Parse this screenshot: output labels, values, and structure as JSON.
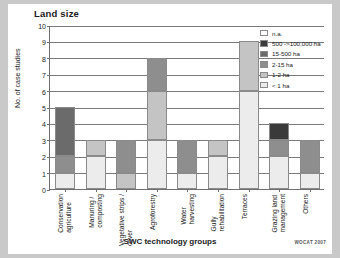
{
  "figure": {
    "title": "Land size",
    "credit": "WOCAT 2007"
  },
  "chart_data": {
    "type": "bar",
    "subtype": "stacked-bar",
    "title": "Land size",
    "xlabel": "SWC technology groups",
    "ylabel": "No. of case studies",
    "ylim": [
      0,
      10
    ],
    "ytick_labels": [
      "0",
      "1",
      "2",
      "3",
      "4",
      "5",
      "6",
      "7",
      "8",
      "9",
      "10"
    ],
    "grid": "horizontal",
    "legend_position": "top-right",
    "categories": [
      "Conservation agriculture",
      "Manuring / composting",
      "Vegetative strips / cover",
      "Agroforestry",
      "Water harvesting",
      "Gully rehabilitation",
      "Terraces",
      "Grazing land management",
      "Others"
    ],
    "series": [
      {
        "name": "< 1 ha",
        "color": "#ececec",
        "values": [
          1,
          2,
          0,
          3,
          1,
          2,
          6,
          2,
          1
        ]
      },
      {
        "name": "1-2 ha",
        "color": "#c4c4c4",
        "values": [
          0,
          1,
          1,
          3,
          0,
          1,
          3,
          0,
          0
        ]
      },
      {
        "name": "2-15 ha",
        "color": "#8e8e8e",
        "values": [
          1,
          0,
          2,
          2,
          2,
          0,
          0,
          1,
          2
        ]
      },
      {
        "name": "15-500 ha",
        "color": "#6b6b6b",
        "values": [
          3,
          0,
          0,
          0,
          0,
          0,
          0,
          0,
          0
        ]
      },
      {
        "name": "500 ->100,000 ha",
        "color": "#3a3a3a",
        "values": [
          0,
          0,
          0,
          0,
          0,
          0,
          0,
          1,
          0
        ]
      },
      {
        "name": "n.a.",
        "color": "#ffffff",
        "values": [
          0,
          0,
          0,
          0,
          0,
          0,
          0,
          0,
          0
        ]
      }
    ],
    "totals": [
      5,
      3,
      3,
      8,
      3,
      3,
      9,
      4,
      3
    ],
    "legend_order": [
      "n.a.",
      "500 ->100,000 ha",
      "15-500 ha",
      "2-15 ha",
      "1-2 ha",
      "< 1 ha"
    ]
  }
}
